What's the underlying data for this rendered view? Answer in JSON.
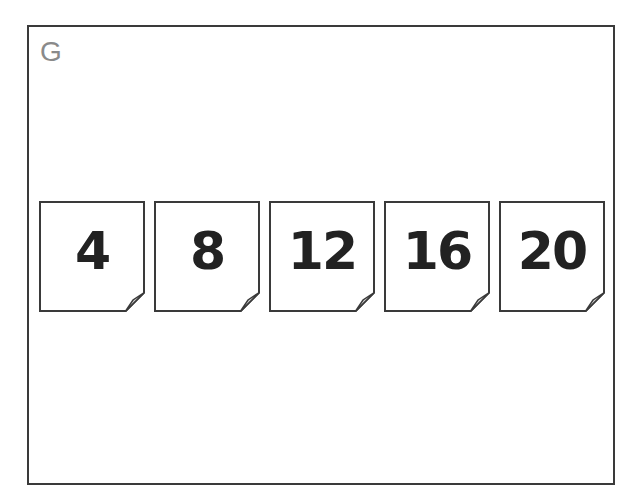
{
  "panel": {
    "label": "G",
    "cards": [
      {
        "value": "4"
      },
      {
        "value": "8"
      },
      {
        "value": "12"
      },
      {
        "value": "16"
      },
      {
        "value": "20"
      }
    ]
  }
}
